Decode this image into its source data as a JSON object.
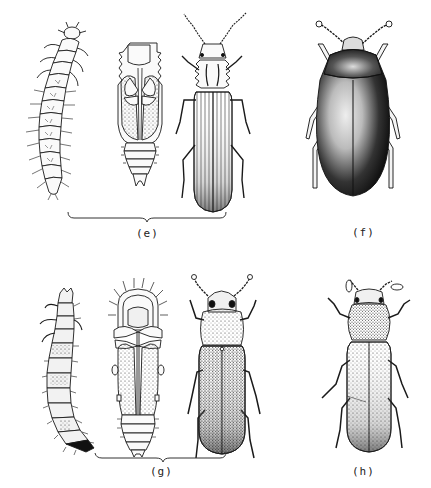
{
  "figure": {
    "groups": [
      {
        "id": "e",
        "label": "(e)",
        "items": [
          "larva",
          "pupa",
          "adult"
        ],
        "adult_style": "elongate, striate elytra, serrated pronotum"
      },
      {
        "id": "f",
        "label": "(f)",
        "items": [
          "adult"
        ],
        "adult_style": "oval, dark shaded body"
      },
      {
        "id": "g",
        "label": "(g)",
        "items": [
          "larva",
          "pupa",
          "adult"
        ],
        "adult_style": "cylindrical, punctate elytra"
      },
      {
        "id": "h",
        "label": "(h)",
        "items": [
          "adult"
        ],
        "adult_style": "flattened, punctate elytra"
      }
    ],
    "colors": {
      "ink": "#1a1a1a",
      "background": "#ffffff",
      "shade": "#2a2a2a"
    }
  }
}
